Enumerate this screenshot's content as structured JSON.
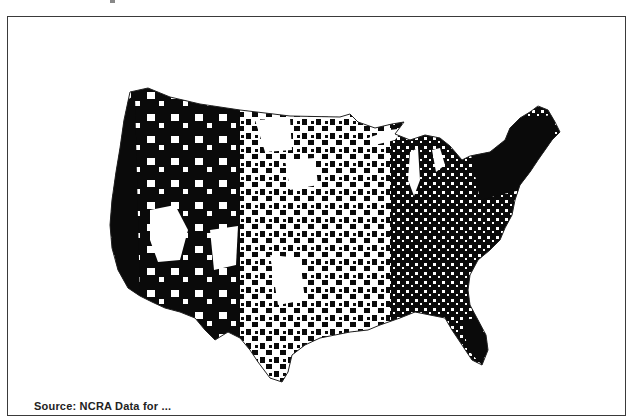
{
  "figure": {
    "type": "choropleth-map",
    "region": "Contiguous United States (county level)",
    "legend": [],
    "colors": {
      "filled": "#0a0a0a",
      "empty": "#ffffff",
      "frame": "#3a3a3a"
    }
  },
  "caption": {
    "text": "Source: NCRA Data for ..."
  }
}
